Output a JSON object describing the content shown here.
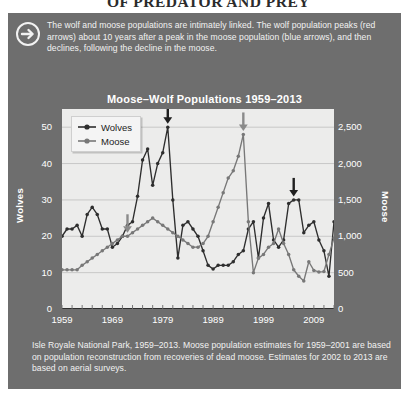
{
  "page_title": "OF PREDATOR AND PREY",
  "callout": {
    "icon": "circle-arrow-right-icon",
    "text": "The wolf and moose populations are intimately linked. The wolf population peaks (red arrows) about 10 years after a peak in the moose population (blue arrows), and then declines, following the decline in the moose."
  },
  "footnote": "Isle Royale National Park, 1959–2013. Moose population estimates for 1959–2001 are based on population reconstruction from recoveries of dead moose. Estimates for 2002 to 2013 are based on aerial surveys.",
  "colors": {
    "panel_bg": "#6e6e6e",
    "plot_bg": "#ececeb",
    "wolves_series": "#2e2e2e",
    "moose_series": "#787878",
    "wolf_arrow": "#1f1f1f",
    "moose_arrow": "#8a8a8a",
    "grid": "#b8b8b8",
    "text_light": "#f2f2f2"
  },
  "chart_data": {
    "type": "line",
    "title": "Moose–Wolf Populations 1959–2013",
    "xlabel": "",
    "ylabel": "Wolves",
    "y2label": "Moose",
    "grid": true,
    "legend_position": "top-left",
    "xlim": [
      1959,
      2013
    ],
    "ylim": [
      0,
      55
    ],
    "y2lim": [
      0,
      2750
    ],
    "yticks": [
      0,
      10,
      20,
      30,
      40,
      50
    ],
    "ytick_labels": [
      "0",
      "10",
      "20",
      "30",
      "40",
      "50"
    ],
    "y2ticks": [
      0,
      500,
      1000,
      1500,
      2000,
      2500
    ],
    "y2tick_labels": [
      "0",
      "500",
      "1,000",
      "1,500",
      "2,000",
      "2,500"
    ],
    "xticks": [
      1959,
      1969,
      1979,
      1989,
      1999,
      2009
    ],
    "xtick_labels": [
      "1959",
      "1969",
      "1979",
      "1989",
      "1999",
      "2009"
    ],
    "x": [
      1959,
      1960,
      1961,
      1962,
      1963,
      1964,
      1965,
      1966,
      1967,
      1968,
      1969,
      1970,
      1971,
      1972,
      1973,
      1974,
      1975,
      1976,
      1977,
      1978,
      1979,
      1980,
      1981,
      1982,
      1983,
      1984,
      1985,
      1986,
      1987,
      1988,
      1989,
      1990,
      1991,
      1992,
      1993,
      1994,
      1995,
      1996,
      1997,
      1998,
      1999,
      2000,
      2001,
      2002,
      2003,
      2004,
      2005,
      2006,
      2007,
      2008,
      2009,
      2010,
      2011,
      2012,
      2013
    ],
    "series": [
      {
        "name": "Wolves",
        "axis": "left",
        "values": [
          20,
          22,
          22,
          23,
          20,
          26,
          28,
          26,
          22,
          22,
          17,
          18,
          20,
          23,
          24,
          31,
          41,
          44,
          34,
          40,
          43,
          50,
          30,
          14,
          23,
          24,
          22,
          20,
          16,
          12,
          11,
          12,
          12,
          12,
          13,
          15,
          16,
          22,
          24,
          14,
          25,
          29,
          19,
          17,
          19,
          29,
          30,
          30,
          21,
          23,
          24,
          19,
          16,
          9,
          24
        ]
      },
      {
        "name": "Moose",
        "axis": "right",
        "values": [
          538,
          538,
          538,
          538,
          600,
          650,
          700,
          750,
          800,
          850,
          900,
          950,
          1000,
          1000,
          1050,
          1100,
          1150,
          1200,
          1250,
          1200,
          1150,
          1100,
          1050,
          1000,
          950,
          900,
          850,
          850,
          900,
          1000,
          1200,
          1400,
          1600,
          1800,
          1900,
          2100,
          2400,
          1200,
          500,
          700,
          750,
          850,
          900,
          1100,
          900,
          750,
          540,
          450,
          385,
          650,
          530,
          510,
          515,
          750,
          975
        ]
      }
    ],
    "annotations": [
      {
        "name": "moose-peak-arrow-1",
        "type": "arrow-down",
        "series": "Moose",
        "x": 1972,
        "color_role": "moose_arrow"
      },
      {
        "name": "wolf-peak-arrow-1",
        "type": "arrow-down",
        "series": "Wolves",
        "x": 1980,
        "color_role": "wolf_arrow"
      },
      {
        "name": "moose-peak-arrow-2",
        "type": "arrow-down",
        "series": "Moose",
        "x": 1995,
        "color_role": "moose_arrow"
      },
      {
        "name": "wolf-peak-arrow-2",
        "type": "arrow-down",
        "series": "Wolves",
        "x": 2005,
        "color_role": "wolf_arrow"
      }
    ],
    "legend": [
      {
        "label": "Wolves",
        "marker": "line-dot",
        "color_role": "wolves_series"
      },
      {
        "label": "Moose",
        "marker": "line-dot",
        "color_role": "moose_series"
      }
    ]
  }
}
